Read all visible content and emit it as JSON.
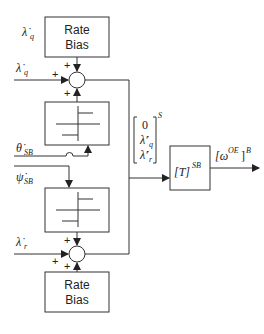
{
  "diagram": {
    "type": "block-diagram",
    "blocks": {
      "rate_bias_top": {
        "line1": "Rate",
        "line2": "Bias"
      },
      "rate_bias_bottom": {
        "line1": "Rate",
        "line2": "Bias"
      },
      "transform": {
        "label": "[T]",
        "superscript": "SB"
      }
    },
    "inputs": {
      "lambda_q_bias": {
        "symbol": "λ̇",
        "subscript": "q"
      },
      "lambda_q": {
        "symbol": "λ̇",
        "subscript": "q"
      },
      "theta_sb": {
        "symbol": "θ̇",
        "subscript": "SB"
      },
      "psi_sb": {
        "symbol": "ψ̇",
        "subscript": "SB"
      },
      "lambda_r": {
        "symbol": "λ̇",
        "subscript": "r"
      }
    },
    "signs": {
      "top_sum_top": "+",
      "top_sum_left": "+",
      "top_sum_bottom": "+",
      "bottom_sum_top": "+",
      "bottom_sum_left": "+",
      "bottom_sum_bottom": "+"
    },
    "vector": {
      "row0": "0",
      "row1_symbol": "λ̇′",
      "row1_sub": "q",
      "row2_symbol": "λ̇′",
      "row2_sub": "r",
      "superscript": "S"
    },
    "output": {
      "label": "[ω",
      "label_sup": "OE",
      "bracket": "]",
      "frame_sup": "B"
    },
    "colors": {
      "stroke": "#333333",
      "text": "#222222",
      "background": "#ffffff"
    }
  }
}
